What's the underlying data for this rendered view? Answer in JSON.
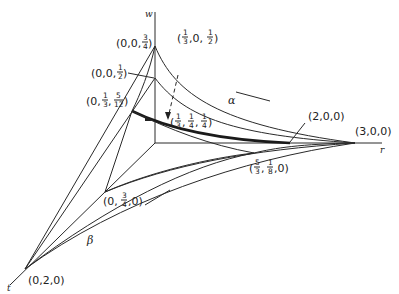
{
  "diagram": {
    "axes": {
      "w": "w",
      "r": "r",
      "t": "t"
    },
    "curves": {
      "alpha": "α",
      "beta": "β"
    },
    "points": [
      {
        "id": "p-0-0-3q",
        "parts": [
          "(0,0,",
          {
            "num": "3",
            "den": "4"
          },
          ")"
        ]
      },
      {
        "id": "p-0-0-h",
        "parts": [
          "(0,0,",
          {
            "num": "1",
            "den": "2"
          },
          ")"
        ]
      },
      {
        "id": "p-0-3rd-5-12",
        "parts": [
          "(0,",
          {
            "num": "1",
            "den": "3"
          },
          ",",
          {
            "num": "5",
            "den": "12"
          },
          ")"
        ]
      },
      {
        "id": "p-3rd-0-h",
        "parts": [
          "(",
          {
            "num": "1",
            "den": "3"
          },
          ",0,",
          {
            "num": "1",
            "den": "2"
          },
          ")"
        ]
      },
      {
        "id": "p-3rd-q-q",
        "parts": [
          "(",
          {
            "num": "1",
            "den": "3"
          },
          ",",
          {
            "num": "1",
            "den": "4"
          },
          ",",
          {
            "num": "1",
            "den": "4"
          },
          ")"
        ]
      },
      {
        "id": "p-2-0-0",
        "parts": [
          "(2,0,0)"
        ]
      },
      {
        "id": "p-3-0-0",
        "parts": [
          "(3,0,0)"
        ]
      },
      {
        "id": "p-5-3-1-8-0",
        "parts": [
          "(",
          {
            "num": "5",
            "den": "3"
          },
          ",",
          {
            "num": "1",
            "den": "8"
          },
          ",0)"
        ]
      },
      {
        "id": "p-0-3q-0",
        "parts": [
          "(0,",
          {
            "num": "3",
            "den": "4"
          },
          ",0)"
        ]
      },
      {
        "id": "p-0-2-0",
        "parts": [
          "(0,2,0)"
        ]
      }
    ],
    "labels": {
      "p_0_0_3q": {
        "a": "(0,0,",
        "num": "3",
        "den": "4",
        "b": ")"
      },
      "p_0_0_h": {
        "a": "(0,0,",
        "num": "1",
        "den": "2",
        "b": ")"
      },
      "p_0_3rd_5_12": {
        "a": "(0,",
        "n1": "1",
        "d1": "3",
        "c": ",",
        "n2": "5",
        "d2": "12",
        "b": ")"
      },
      "p_3rd_0_h": {
        "a": "(",
        "n1": "1",
        "d1": "3",
        "c": ",0,",
        "n2": "1",
        "d2": "2",
        "b": ")"
      },
      "p_3rd_q_q": {
        "a": "(",
        "n1": "1",
        "d1": "3",
        "c1": ",",
        "n2": "1",
        "d2": "4",
        "c2": ",",
        "n3": "1",
        "d3": "4",
        "b": ")"
      },
      "p_2_0_0": "(2,0,0)",
      "p_3_0_0": "(3,0,0)",
      "p_5_3_1_8_0": {
        "a": "(",
        "n1": "5",
        "d1": "3",
        "c": ",",
        "n2": "1",
        "d2": "8",
        "b": ",0)"
      },
      "p_0_3q_0": {
        "a": "(0,",
        "num": "3",
        "den": "4",
        "b": ",0)"
      },
      "p_0_2_0": "(0,2,0)"
    }
  }
}
